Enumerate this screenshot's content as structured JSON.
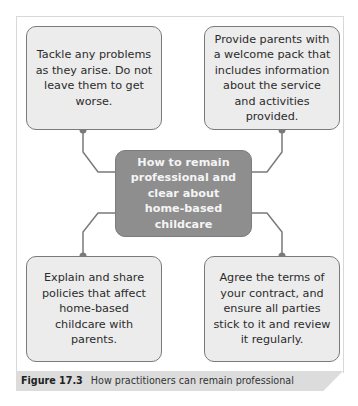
{
  "figure": {
    "center": {
      "text": "How to remain professional and clear about home-based childcare"
    },
    "nodes": [
      {
        "id": "top-left",
        "text": "Tackle any problems as they arise. Do not leave them to get worse."
      },
      {
        "id": "top-right",
        "text": "Provide parents with a welcome pack that includes information about the service and activities provided."
      },
      {
        "id": "bottom-left",
        "text": "Explain and share policies that affect home-based childcare with parents."
      },
      {
        "id": "bottom-right",
        "text": "Agree the terms of your contract, and ensure all parties stick to it and review it regularly."
      }
    ],
    "caption": {
      "label": "Figure 17.3",
      "text": "How practitioners can remain professional"
    },
    "colors": {
      "node_fill": "#ececec",
      "node_border": "#7a7a7a",
      "center_fill": "#8e8e8e",
      "center_text": "#f4f4f4",
      "connector": "#7a7a7a",
      "caption_bar": "#dcdcdc"
    }
  }
}
